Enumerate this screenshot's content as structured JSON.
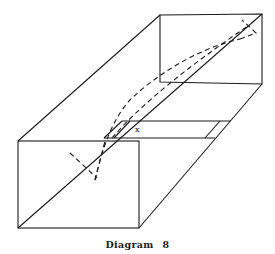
{
  "diagram": {
    "caption_word": "Diagram",
    "caption_number": "8",
    "point_label": "x",
    "line_color": "#1a1a1a",
    "background": "#ffffff"
  }
}
